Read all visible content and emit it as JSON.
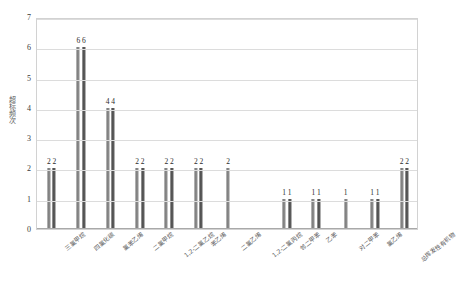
{
  "chart_data": {
    "type": "bar",
    "title": "",
    "xlabel": "",
    "ylabel": "超标频次",
    "ylim": [
      0,
      7
    ],
    "ytick_step": 1,
    "yticks": [
      "7",
      "6",
      "5",
      "4",
      "3",
      "2",
      "1",
      "0"
    ],
    "grid": true,
    "legend": "none",
    "categories": [
      "三氯甲烷",
      "四氯化碳",
      "氯苯乙烯",
      "二氯甲烷",
      "1,2-二氯乙烷",
      "苯乙烯",
      "二氯乙烯",
      "1,2-二氯丙烷",
      "邻二甲苯",
      "乙苯",
      "对二甲苯",
      "氯乙烯",
      "总挥发性有机物"
    ],
    "series": [
      {
        "name": "系列1",
        "values": [
          2,
          6,
          4,
          2,
          2,
          2,
          2,
          null,
          1,
          1,
          1,
          1,
          2
        ]
      },
      {
        "name": "系列2",
        "values": [
          2,
          6,
          4,
          2,
          2,
          2,
          null,
          null,
          1,
          1,
          null,
          1,
          2
        ]
      }
    ],
    "data_labels": [
      [
        "2",
        "2"
      ],
      [
        "6",
        "6"
      ],
      [
        "4",
        "4"
      ],
      [
        "2",
        "2"
      ],
      [
        "2",
        "2"
      ],
      [
        "2",
        "2"
      ],
      [
        "2",
        ""
      ],
      [
        "",
        ""
      ],
      [
        "1",
        "1"
      ],
      [
        "1",
        "1"
      ],
      [
        "1",
        ""
      ],
      [
        "1",
        "1"
      ],
      [
        "2",
        "2"
      ]
    ],
    "colors": {
      "bar_light": "#8f8f8f",
      "bar_dark": "#4a4a4a",
      "grid": "#dcdcdc",
      "axis": "#a9a9a9",
      "text": "#3a3a3a"
    }
  }
}
